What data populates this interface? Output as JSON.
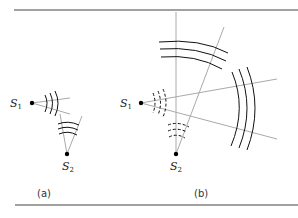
{
  "figure": {
    "panels": [
      {
        "caption": "(a)",
        "sources": [
          {
            "label": "S",
            "subscript": "1"
          },
          {
            "label": "S",
            "subscript": "2"
          }
        ]
      },
      {
        "caption": "(b)",
        "sources": [
          {
            "label": "S",
            "subscript": "1"
          },
          {
            "label": "S",
            "subscript": "2"
          }
        ]
      }
    ],
    "colors": {
      "rule": "#444444",
      "ray": "#a8a8a8",
      "wave": "#1a1a1a",
      "dot": "#000000"
    }
  }
}
